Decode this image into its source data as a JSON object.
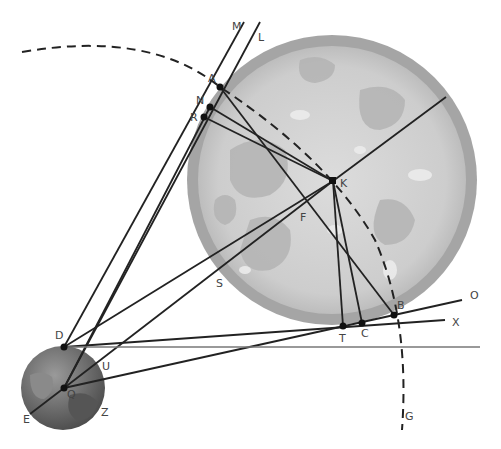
{
  "diagram": {
    "type": "geometric astronomy construction",
    "bodies": [
      {
        "name": "large-sphere",
        "center": [
          332,
          180
        ],
        "radius": 145,
        "color": "#c8c8c8",
        "rim_color": "#a3a3a3"
      },
      {
        "name": "small-earth",
        "center": [
          63,
          388
        ],
        "radius": 42,
        "color": "#6f6f6f"
      }
    ],
    "points": {
      "A": {
        "label": "A",
        "pos": [
          220,
          87
        ],
        "label_pos": [
          208,
          82
        ]
      },
      "N": {
        "label": "N",
        "pos": [
          210,
          107
        ],
        "label_pos": [
          196,
          104
        ]
      },
      "R": {
        "label": "R",
        "pos": [
          204,
          117
        ],
        "label_pos": [
          190,
          121
        ]
      },
      "K": {
        "label": "K",
        "pos": [
          333,
          181
        ],
        "label_pos": [
          340,
          187
        ]
      },
      "F": {
        "label": "F",
        "pos": [
          302,
          218
        ],
        "label_pos": [
          300,
          221
        ]
      },
      "S": {
        "label": "S",
        "pos": [
          218,
          284
        ],
        "label_pos": [
          216,
          287
        ]
      },
      "B": {
        "label": "B",
        "pos": [
          394,
          315
        ],
        "label_pos": [
          397,
          309
        ]
      },
      "C": {
        "label": "C",
        "pos": [
          362,
          323
        ],
        "label_pos": [
          361,
          337
        ]
      },
      "T": {
        "label": "T",
        "pos": [
          343,
          326
        ],
        "label_pos": [
          339,
          342
        ]
      },
      "O": {
        "label": "O",
        "pos": [
          462,
          300
        ],
        "label_pos": [
          470,
          299
        ]
      },
      "X": {
        "label": "X",
        "pos": [
          445,
          320
        ],
        "label_pos": [
          452,
          326
        ]
      },
      "D": {
        "label": "D",
        "pos": [
          64,
          347
        ],
        "label_pos": [
          55,
          339
        ]
      },
      "U": {
        "label": "U",
        "pos": [
          103,
          366
        ],
        "label_pos": [
          102,
          370
        ]
      },
      "Q": {
        "label": "Q",
        "pos": [
          64,
          388
        ],
        "label_pos": [
          67,
          398
        ]
      },
      "E": {
        "label": "E",
        "pos": [
          30,
          414
        ],
        "label_pos": [
          23,
          423
        ]
      },
      "Z": {
        "label": "Z",
        "pos": [
          103,
          412
        ],
        "label_pos": [
          101,
          416
        ]
      },
      "M": {
        "label": "M",
        "pos": [
          244,
          22
        ],
        "label_pos": [
          232,
          30
        ]
      },
      "L": {
        "label": "L",
        "pos": [
          260,
          22
        ],
        "label_pos": [
          258,
          41
        ]
      },
      "G": {
        "label": "G",
        "pos": [
          402,
          430
        ],
        "label_pos": [
          405,
          420
        ]
      }
    },
    "labels": [
      "A",
      "N",
      "R",
      "K",
      "F",
      "S",
      "B",
      "C",
      "T",
      "O",
      "X",
      "D",
      "U",
      "Q",
      "E",
      "Z",
      "M",
      "L",
      "G"
    ]
  }
}
